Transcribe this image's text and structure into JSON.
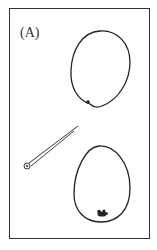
{
  "figure": {
    "panel_label": "(A)",
    "elements": [
      {
        "name": "upper-egg",
        "description": "egg-shaped outline with small dot near bottom"
      },
      {
        "name": "micropipette",
        "description": "diagonal needle pointing toward upper egg"
      },
      {
        "name": "lower-egg",
        "description": "egg-shaped outline with dark cluster near bottom"
      }
    ],
    "colors": {
      "stroke": "#222222",
      "background": "#ffffff"
    }
  }
}
